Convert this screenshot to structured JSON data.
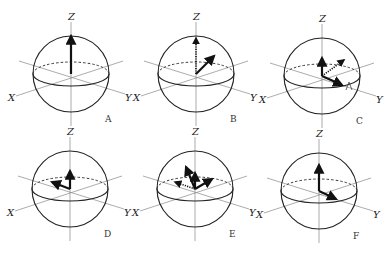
{
  "figure": {
    "panels": [
      {
        "id": "A",
        "caption": "A",
        "cx": 71,
        "cy": 74,
        "axes": {
          "x": "X",
          "y": "Y",
          "z": "Z"
        },
        "vectors": [
          {
            "dx": 0,
            "dy": -38,
            "style": "solid"
          }
        ]
      },
      {
        "id": "B",
        "caption": "B",
        "cx": 196,
        "cy": 74,
        "axes": {
          "x": "X",
          "y": "Y",
          "z": "Z"
        },
        "vectors": [
          {
            "dx": 0,
            "dy": -36,
            "style": "dotted"
          },
          {
            "dx": 18,
            "dy": -18,
            "style": "solid"
          }
        ]
      },
      {
        "id": "C",
        "caption": "C",
        "cx": 322,
        "cy": 76,
        "axes": {
          "x": "X",
          "y": "Y",
          "z": "Z"
        },
        "vectors": [
          {
            "dx": 0,
            "dy": -18,
            "style": "solid"
          },
          {
            "dx": 22,
            "dy": -16,
            "style": "dotted"
          },
          {
            "dx": 20,
            "dy": 9,
            "style": "solid"
          }
        ],
        "rotation_marker": true
      },
      {
        "id": "D",
        "caption": "D",
        "cx": 70,
        "cy": 189,
        "axes": {
          "x": "X",
          "y": "Y",
          "z": "Z"
        },
        "vectors": [
          {
            "dx": 0,
            "dy": -18,
            "style": "solid"
          },
          {
            "dx": -18,
            "dy": -7,
            "style": "solid"
          }
        ]
      },
      {
        "id": "E",
        "caption": "E",
        "cx": 195,
        "cy": 189,
        "axes": {
          "x": "X",
          "y": "Y",
          "z": "Z"
        },
        "vectors": [
          {
            "dx": 0,
            "dy": -16,
            "style": "solid"
          },
          {
            "dx": -9,
            "dy": -22,
            "style": "solid"
          },
          {
            "dx": -20,
            "dy": -7,
            "style": "dotted"
          },
          {
            "dx": 17,
            "dy": -10,
            "style": "solid"
          }
        ]
      },
      {
        "id": "F",
        "caption": "F",
        "cx": 319,
        "cy": 191,
        "axes": {
          "x": "X",
          "y": "Y",
          "z": "Z"
        },
        "vectors": [
          {
            "dx": 0,
            "dy": -26,
            "style": "solid"
          },
          {
            "dx": 17,
            "dy": 8,
            "style": "solid"
          }
        ]
      }
    ]
  }
}
